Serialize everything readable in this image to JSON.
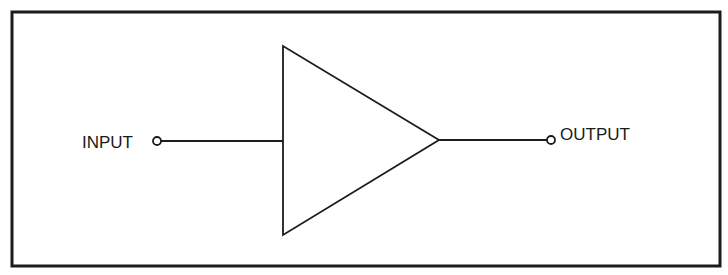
{
  "diagram": {
    "type": "amplifier-block-symbol",
    "frame": {
      "x": 12,
      "y": 12,
      "width": 708,
      "height": 254,
      "stroke": "#1c1c1c",
      "stroke_width": 3
    },
    "amplifier": {
      "shape": "triangle",
      "points": [
        [
          283,
          46
        ],
        [
          283,
          235
        ],
        [
          439,
          140
        ]
      ],
      "stroke": "#1c1c1c"
    },
    "input": {
      "label": "INPUT",
      "label_x": 82,
      "label_y": 148,
      "terminal": {
        "cx": 157,
        "cy": 141,
        "r": 4
      },
      "wire": {
        "x1": 161,
        "y1": 141,
        "x2": 283,
        "y2": 141
      }
    },
    "output": {
      "label": "OUTPUT",
      "label_x": 560,
      "label_y": 140,
      "terminal": {
        "cx": 551,
        "cy": 140,
        "r": 4
      },
      "wire": {
        "x1": 439,
        "y1": 140,
        "x2": 547,
        "y2": 140
      }
    },
    "colors": {
      "line": "#1c1c1c",
      "background": "#ffffff",
      "text": "#1a1a1a"
    }
  }
}
